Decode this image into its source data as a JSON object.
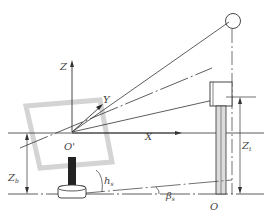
{
  "diagram": {
    "labels": {
      "z_axis": "Z",
      "y_axis": "Y",
      "x_axis": "X",
      "origin_prime": "O'",
      "origin": "O",
      "z_b": "Z",
      "z_b_sub": "b",
      "z_t": "Z",
      "z_t_sub": "t",
      "h_s": "h",
      "h_s_sub": "s",
      "beta_s": "β",
      "beta_s_sub": "s"
    },
    "colors": {
      "line": "#333333",
      "panel": "#d6d6d6",
      "pole_fill": "#d9d9d9",
      "post": "#222222"
    }
  }
}
